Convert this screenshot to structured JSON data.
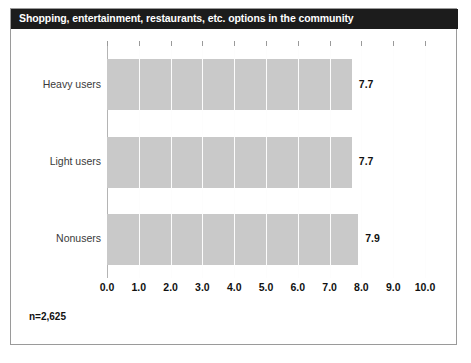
{
  "chart_data": {
    "type": "bar",
    "orientation": "horizontal",
    "title": "Shopping, entertainment, restaurants, etc. options in the community",
    "categories": [
      "Heavy users",
      "Light users",
      "Nonusers"
    ],
    "values": [
      7.7,
      7.7,
      7.9
    ],
    "value_labels": [
      "7.7",
      "7.7",
      "7.9"
    ],
    "xlabel": "",
    "ylabel": "",
    "xlim": [
      0.0,
      10.0
    ],
    "xticks": [
      0.0,
      1.0,
      2.0,
      3.0,
      4.0,
      5.0,
      6.0,
      7.0,
      8.0,
      9.0,
      10.0
    ],
    "xtick_labels": [
      "0.0",
      "1.0",
      "2.0",
      "3.0",
      "4.0",
      "5.0",
      "6.0",
      "7.0",
      "8.0",
      "9.0",
      "10.0"
    ],
    "grid": true,
    "legend": null,
    "annotation": "n=2,625",
    "colors": {
      "bar_fill": "#c9c9c9",
      "title_bar_background": "#1c1c1c",
      "title_text": "#ffffff",
      "gridline": "#d4d4d4",
      "frame_border": "#9a9a9a",
      "axis_text": "#111111",
      "category_text": "#3a3a3a"
    }
  },
  "header": {
    "title": "Shopping, entertainment, restaurants, etc. options in the community"
  },
  "footer": {
    "sample_size": "n=2,625"
  }
}
